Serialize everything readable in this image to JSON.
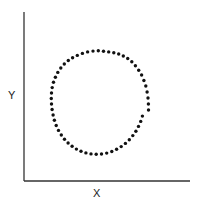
{
  "chart_data": {
    "type": "scatter",
    "title": "",
    "xlabel": "X",
    "ylabel": "Y",
    "grid": false,
    "legend": null,
    "xlim": [
      0,
      166
    ],
    "ylim": [
      0,
      169
    ],
    "shape_description": "Points arranged in a circle (no linear correlation)",
    "points": [
      [
        124.5,
        71
      ],
      [
        124.4,
        77
      ],
      [
        124,
        83
      ],
      [
        123.1,
        89
      ],
      [
        121.8,
        95
      ],
      [
        119.9,
        100.5
      ],
      [
        117.6,
        106
      ],
      [
        114.7,
        110.8
      ],
      [
        111.4,
        115.3
      ],
      [
        107.8,
        119.3
      ],
      [
        103.7,
        122.5
      ],
      [
        99.3,
        125
      ],
      [
        94.7,
        127
      ],
      [
        89.8,
        128.2
      ],
      [
        84.7,
        129.1
      ],
      [
        79.5,
        129.7
      ],
      [
        74.3,
        130.2
      ],
      [
        69,
        129.9
      ],
      [
        63.6,
        129.1
      ],
      [
        58.4,
        127.6
      ],
      [
        53.3,
        125.6
      ],
      [
        48.6,
        123.3
      ],
      [
        44.3,
        120.5
      ],
      [
        40.3,
        117
      ],
      [
        36.8,
        113
      ],
      [
        33.8,
        108.6
      ],
      [
        31.4,
        103.8
      ],
      [
        29.5,
        98.7
      ],
      [
        28.2,
        93.4
      ],
      [
        27.5,
        88
      ],
      [
        27.3,
        82.5
      ],
      [
        27.5,
        77
      ],
      [
        28.1,
        71.5
      ],
      [
        29.1,
        66
      ],
      [
        30.4,
        60.7
      ],
      [
        32.2,
        55.5
      ],
      [
        34.5,
        50.6
      ],
      [
        37.3,
        46
      ],
      [
        40.5,
        41.8
      ],
      [
        44.1,
        38
      ],
      [
        48.1,
        34.7
      ],
      [
        52.4,
        31.9
      ],
      [
        57,
        29.7
      ],
      [
        61.9,
        28.1
      ],
      [
        67,
        27.1
      ],
      [
        72.2,
        26.7
      ],
      [
        77.5,
        27
      ],
      [
        82.7,
        27.9
      ],
      [
        87.8,
        29.5
      ],
      [
        92.6,
        31.7
      ],
      [
        97.2,
        34.4
      ],
      [
        101.4,
        37.6
      ],
      [
        105.3,
        41.3
      ],
      [
        108.8,
        45.4
      ],
      [
        111.9,
        49.8
      ],
      [
        114.5,
        54.6
      ],
      [
        116.7,
        59.6
      ],
      [
        118.4,
        64.9
      ]
    ],
    "marker": {
      "shape": "circle",
      "size": 3.4,
      "color": "#111111"
    }
  },
  "axes": {
    "color": "#333333",
    "origin_px": [
      24,
      181
    ],
    "x_end_px": 190,
    "y_end_px": 12
  },
  "labels": {
    "x": "X",
    "y": "Y"
  }
}
